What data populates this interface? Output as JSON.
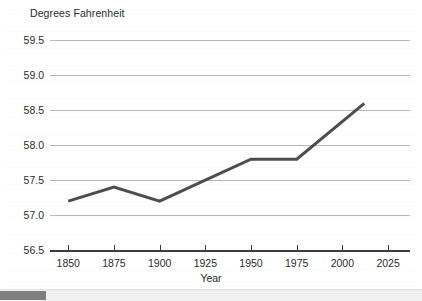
{
  "chart_data": {
    "type": "line",
    "title": "",
    "subtitle": "",
    "xlabel": "Year",
    "ylabel": "Degrees Fahrenheit",
    "xlim": [
      1840,
      2037
    ],
    "ylim": [
      56.5,
      59.65
    ],
    "xticks": [
      1850,
      1875,
      1900,
      1925,
      1950,
      1975,
      2000,
      2025
    ],
    "xtick_labels": [
      "1850",
      "1875",
      "1900",
      "1925",
      "1950",
      "1975",
      "2000",
      "2025"
    ],
    "yticks": [
      56.5,
      57.0,
      57.5,
      58.0,
      58.5,
      59.0,
      59.5
    ],
    "ytick_labels": [
      "56.5",
      "57.0",
      "57.5",
      "58.0",
      "58.5",
      "59.0",
      "59.5"
    ],
    "grid": true,
    "grid_axis": "y",
    "legend": false,
    "legend_position": "none",
    "line_color": "#4d4d4d",
    "line_width": 3,
    "gridline_color": "#b7b7b7",
    "axis_color": "#3d3d3d",
    "text_color": "#2b2b2b",
    "background_color": "#ffffff",
    "series": [
      {
        "name": "Global average temperature",
        "x": [
          1850,
          1875,
          1900,
          1925,
          1950,
          1975,
          2012
        ],
        "values": [
          57.2,
          57.4,
          57.2,
          57.5,
          57.8,
          57.8,
          58.6
        ]
      }
    ]
  },
  "scrollbar": {
    "orientation": "horizontal",
    "thumb_position_percent": 0,
    "thumb_width_percent": 11
  }
}
